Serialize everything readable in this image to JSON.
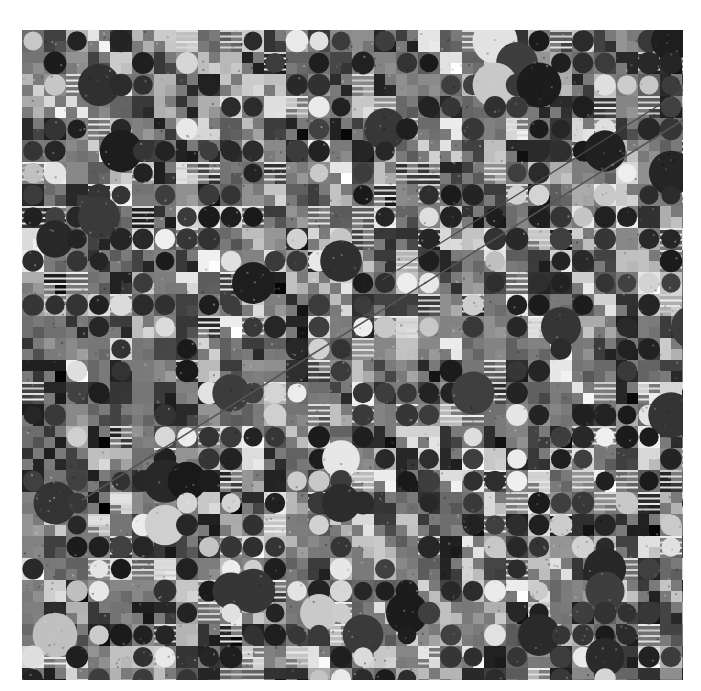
{
  "image": {
    "description": "Grayscale satellite photograph of agricultural land with center-pivot irrigation circles and rectangular fields",
    "frame": {
      "x": 22,
      "y": 30,
      "width": 661,
      "height": 650
    },
    "palette": {
      "background": "#ffffff",
      "field_dark": "#2a2a2a",
      "field_mid": "#6e6e6e",
      "field_light": "#d8d8d8",
      "base": "#7a7a7a"
    },
    "features": {
      "grid_cell_size": 22,
      "circle_fields": true,
      "diagonal_roads": 2
    }
  }
}
